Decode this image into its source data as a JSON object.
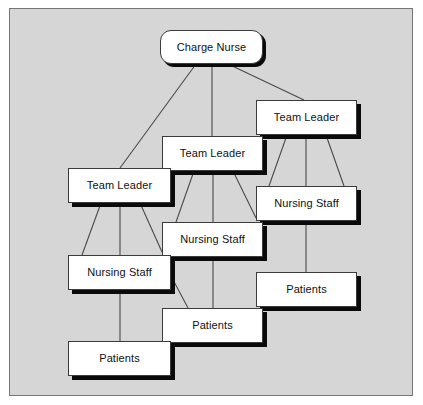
{
  "diagram": {
    "background_color": "#d6d6d6",
    "frame_border_color": "#767676",
    "node_fill_color": "#ffffff",
    "node_border_color": "#3b3b3b",
    "node_shadow_color": "#0a0a0a",
    "edge_color": "#4a4a4a",
    "nodes": [
      {
        "id": "charge-nurse",
        "label": "Charge Nurse",
        "level": "charge-nurse",
        "shape": "rounded-rectangle",
        "x": 160,
        "y": 30,
        "w": 103,
        "h": 34
      },
      {
        "id": "team-leader-3",
        "label": "Team Leader",
        "level": "team-leader",
        "shape": "rectangle",
        "x": 256,
        "y": 100,
        "w": 101,
        "h": 35
      },
      {
        "id": "team-leader-2",
        "label": "Team Leader",
        "level": "team-leader",
        "shape": "rectangle",
        "x": 162,
        "y": 136,
        "w": 101,
        "h": 35
      },
      {
        "id": "team-leader-1",
        "label": "Team Leader",
        "level": "team-leader",
        "shape": "rectangle",
        "x": 68,
        "y": 168,
        "w": 103,
        "h": 35
      },
      {
        "id": "nursing-staff-3",
        "label": "Nursing Staff",
        "level": "nursing-staff",
        "shape": "rectangle",
        "x": 256,
        "y": 186,
        "w": 101,
        "h": 35
      },
      {
        "id": "nursing-staff-2",
        "label": "Nursing Staff",
        "level": "nursing-staff",
        "shape": "rectangle",
        "x": 162,
        "y": 222,
        "w": 101,
        "h": 35
      },
      {
        "id": "nursing-staff-1",
        "label": "Nursing Staff",
        "level": "nursing-staff",
        "shape": "rectangle",
        "x": 68,
        "y": 255,
        "w": 103,
        "h": 35
      },
      {
        "id": "patients-3",
        "label": "Patients",
        "level": "patients",
        "shape": "rectangle",
        "x": 256,
        "y": 272,
        "w": 101,
        "h": 35
      },
      {
        "id": "patients-2",
        "label": "Patients",
        "level": "patients",
        "shape": "rectangle",
        "x": 162,
        "y": 308,
        "w": 101,
        "h": 35
      },
      {
        "id": "patients-1",
        "label": "Patients",
        "level": "patients",
        "shape": "rectangle",
        "x": 68,
        "y": 341,
        "w": 103,
        "h": 35
      }
    ],
    "edges": [
      {
        "from": "charge-nurse",
        "to": "team-leader-1"
      },
      {
        "from": "charge-nurse",
        "to": "team-leader-2"
      },
      {
        "from": "charge-nurse",
        "to": "team-leader-3"
      },
      {
        "from": "team-leader-1",
        "to": "nursing-staff-1"
      },
      {
        "from": "team-leader-1",
        "to": "nursing-staff-1"
      },
      {
        "from": "team-leader-1",
        "to": "nursing-staff-2"
      },
      {
        "from": "team-leader-2",
        "to": "nursing-staff-2"
      },
      {
        "from": "team-leader-2",
        "to": "nursing-staff-2"
      },
      {
        "from": "team-leader-2",
        "to": "nursing-staff-3"
      },
      {
        "from": "team-leader-3",
        "to": "nursing-staff-3"
      },
      {
        "from": "team-leader-3",
        "to": "nursing-staff-3"
      },
      {
        "from": "nursing-staff-1",
        "to": "patients-1"
      },
      {
        "from": "nursing-staff-1",
        "to": "patients-2"
      },
      {
        "from": "nursing-staff-2",
        "to": "patients-2"
      },
      {
        "from": "nursing-staff-3",
        "to": "patients-3"
      }
    ]
  }
}
